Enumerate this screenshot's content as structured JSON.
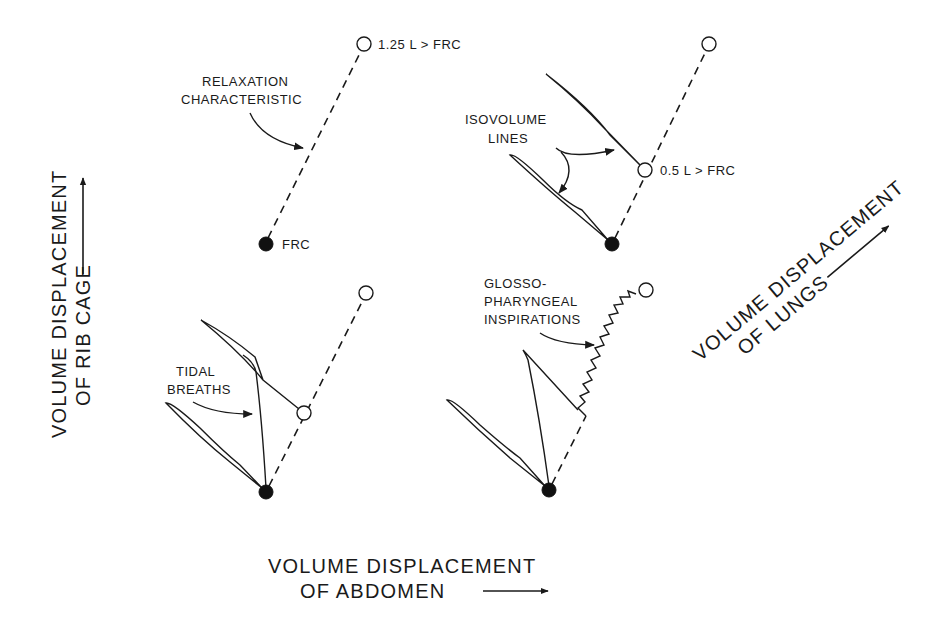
{
  "figure": {
    "axes": {
      "y_label_line1": "VOLUME DISPLACEMENT",
      "y_label_line2": "OF RIB CAGE",
      "x_label_line1": "VOLUME DISPLACEMENT",
      "x_label_line2": "OF ABDOMEN",
      "diag_label_line1": "VOLUME DISPLACEMENT",
      "diag_label_line2": "OF LUNGS"
    },
    "panels": [
      {
        "id": "top-left",
        "annotation": [
          "RELAXATION",
          "CHARACTERISTIC"
        ],
        "points": [
          {
            "label": "FRC",
            "type": "filled",
            "x": 266,
            "y": 244
          },
          {
            "label": "1.25 L > FRC",
            "type": "open",
            "x": 364,
            "y": 44
          }
        ]
      },
      {
        "id": "top-right",
        "annotation": [
          "ISOVOLUME",
          "LINES"
        ],
        "points": [
          {
            "label": "",
            "type": "filled",
            "x": 612,
            "y": 244
          },
          {
            "label": "0.5 L > FRC",
            "type": "open",
            "x": 645,
            "y": 170
          },
          {
            "label": "",
            "type": "open",
            "x": 709,
            "y": 44
          }
        ]
      },
      {
        "id": "bottom-left",
        "annotation": [
          "TIDAL",
          "BREATHS"
        ],
        "points": [
          {
            "label": "",
            "type": "filled",
            "x": 266,
            "y": 492
          },
          {
            "label": "",
            "type": "open",
            "x": 304,
            "y": 413
          },
          {
            "label": "",
            "type": "open",
            "x": 366,
            "y": 293
          }
        ]
      },
      {
        "id": "bottom-right",
        "annotation": [
          "GLOSSO-",
          "PHARYNGEAL",
          "INSPIRATIONS"
        ],
        "points": [
          {
            "label": "",
            "type": "filled",
            "x": 549,
            "y": 490
          },
          {
            "label": "",
            "type": "open",
            "x": 646,
            "y": 290
          }
        ]
      }
    ],
    "labels": {
      "frc": "FRC",
      "p125": "1.25 L > FRC",
      "p05": "0.5 L > FRC",
      "relax1": "RELAXATION",
      "relax2": "CHARACTERISTIC",
      "iso1": "ISOVOLUME",
      "iso2": "LINES",
      "tidal1": "TIDAL",
      "tidal2": "BREATHS",
      "glosso1": "GLOSSO-",
      "glosso2": "PHARYNGEAL",
      "glosso3": "INSPIRATIONS"
    },
    "colors": {
      "ink": "#1a1a1a",
      "background": "#ffffff"
    }
  }
}
